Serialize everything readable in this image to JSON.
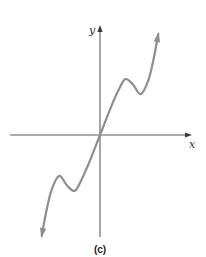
{
  "chart_data": {
    "type": "line",
    "title": "",
    "caption": "(c)",
    "xlabel": "x",
    "ylabel": "y",
    "xlim": [
      -4.5,
      4.5
    ],
    "ylim": [
      -5.0,
      5.0
    ],
    "grid": false,
    "legend": "none",
    "ticks": {
      "x": [],
      "y": []
    },
    "arrows": {
      "curve_start": true,
      "curve_end": true,
      "x_axis_positive": true,
      "y_axis_positive": true
    },
    "series": [
      {
        "name": "f(x)",
        "color": "#8e8e8e",
        "points": [
          [
            -2.65,
            -4.7
          ],
          [
            -2.45,
            -3.6
          ],
          [
            -2.2,
            -2.55
          ],
          [
            -1.85,
            -1.9
          ],
          [
            -1.5,
            -2.35
          ],
          [
            -1.15,
            -2.6
          ],
          [
            -0.85,
            -2.1
          ],
          [
            -0.5,
            -1.3
          ],
          [
            0.0,
            0.0
          ],
          [
            0.5,
            1.3
          ],
          [
            0.85,
            2.1
          ],
          [
            1.15,
            2.6
          ],
          [
            1.5,
            2.35
          ],
          [
            1.85,
            1.9
          ],
          [
            2.2,
            2.55
          ],
          [
            2.45,
            3.6
          ],
          [
            2.65,
            4.7
          ]
        ],
        "features": {
          "local_max": [
            [
              -1.85,
              -1.9
            ],
            [
              1.15,
              2.6
            ]
          ],
          "local_min": [
            [
              -1.15,
              -2.6
            ],
            [
              1.85,
              1.9
            ]
          ],
          "passes_through_origin": true,
          "symmetry": "odd"
        }
      }
    ],
    "colors": {
      "axes": "#5a5a5a",
      "curve": "#8e8e8e",
      "text": "#333333"
    }
  }
}
